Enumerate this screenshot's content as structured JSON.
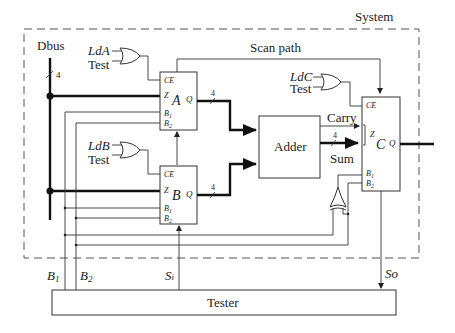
{
  "diagram": {
    "system_label": "System",
    "scan_path_label": "Scan path",
    "dbus_label": "Dbus",
    "bus_width": "4",
    "registers": [
      {
        "name": "A",
        "load_signal": "LdA",
        "test_signal": "Test",
        "pins": {
          "ce": "CE",
          "z": "Z",
          "b1": "B",
          "b1_sub": "1",
          "b2": "B",
          "b2_sub": "2",
          "q": "Q"
        },
        "out_width": "4"
      },
      {
        "name": "B",
        "load_signal": "LdB",
        "test_signal": "Test",
        "pins": {
          "ce": "CE",
          "z": "Z",
          "b1": "B",
          "b1_sub": "1",
          "b2": "B",
          "b2_sub": "2",
          "q": "Q"
        },
        "out_width": "4"
      },
      {
        "name": "C",
        "load_signal": "LdC",
        "test_signal": "Test",
        "pins": {
          "ce": "CE",
          "z": "Z",
          "b1": "B",
          "b1_sub": "1",
          "b2": "B",
          "b2_sub": "2",
          "q": "Q"
        }
      }
    ],
    "adder": {
      "label": "Adder",
      "carry_label": "Carry",
      "sum_label": "Sum",
      "sum_width": "4"
    },
    "tester": {
      "label": "Tester"
    },
    "tester_signals": {
      "b1": "B",
      "b1_sub": "1",
      "b2": "B",
      "b2_sub": "2",
      "si": "S",
      "si_sub": "i",
      "so": "So"
    }
  }
}
